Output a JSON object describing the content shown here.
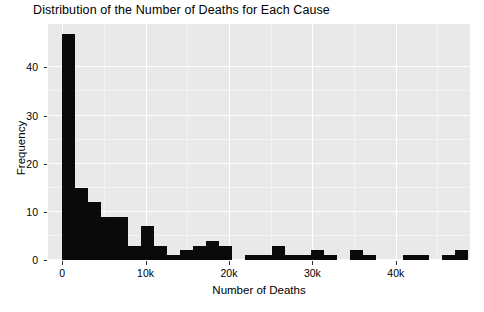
{
  "chart_data": {
    "type": "bar",
    "title": "Distribution of the Number of Deaths for Each Cause",
    "xlabel": "Number of Deaths",
    "ylabel": "Frequency",
    "xlim": [
      -1700,
      48900
    ],
    "ylim": [
      0,
      49
    ],
    "grid": true,
    "legend": null,
    "bin_width": 1570,
    "bar_color": "#0a0a0a",
    "panel_color": "#e9e9e9",
    "grid_color": "#ffffff",
    "xticks": [
      {
        "value": 0,
        "label": "0"
      },
      {
        "value": 10000,
        "label": "10k"
      },
      {
        "value": 20000,
        "label": "20k"
      },
      {
        "value": 30000,
        "label": "30k"
      },
      {
        "value": 40000,
        "label": "40k"
      }
    ],
    "yticks": [
      {
        "value": 0,
        "label": "0"
      },
      {
        "value": 10,
        "label": "10"
      },
      {
        "value": 20,
        "label": "20"
      },
      {
        "value": 30,
        "label": "30"
      },
      {
        "value": 40,
        "label": "40"
      }
    ],
    "bins": [
      {
        "x0": 0,
        "x1": 1570,
        "value": 47
      },
      {
        "x0": 1570,
        "x1": 3140,
        "value": 15
      },
      {
        "x0": 3140,
        "x1": 4710,
        "value": 12
      },
      {
        "x0": 4710,
        "x1": 6280,
        "value": 9
      },
      {
        "x0": 6280,
        "x1": 7850,
        "value": 9
      },
      {
        "x0": 7850,
        "x1": 9420,
        "value": 3
      },
      {
        "x0": 9420,
        "x1": 10990,
        "value": 7
      },
      {
        "x0": 10990,
        "x1": 12560,
        "value": 3
      },
      {
        "x0": 12560,
        "x1": 14130,
        "value": 1
      },
      {
        "x0": 14130,
        "x1": 15700,
        "value": 2
      },
      {
        "x0": 15700,
        "x1": 17270,
        "value": 3
      },
      {
        "x0": 17270,
        "x1": 18840,
        "value": 4
      },
      {
        "x0": 18840,
        "x1": 20410,
        "value": 3
      },
      {
        "x0": 20410,
        "x1": 21980,
        "value": 0
      },
      {
        "x0": 21980,
        "x1": 23550,
        "value": 1
      },
      {
        "x0": 23550,
        "x1": 25120,
        "value": 1
      },
      {
        "x0": 25120,
        "x1": 26690,
        "value": 3
      },
      {
        "x0": 26690,
        "x1": 28260,
        "value": 1
      },
      {
        "x0": 28260,
        "x1": 29830,
        "value": 1
      },
      {
        "x0": 29830,
        "x1": 31400,
        "value": 2
      },
      {
        "x0": 31400,
        "x1": 32970,
        "value": 1
      },
      {
        "x0": 32970,
        "x1": 34540,
        "value": 0
      },
      {
        "x0": 34540,
        "x1": 36110,
        "value": 2
      },
      {
        "x0": 36110,
        "x1": 37680,
        "value": 1
      },
      {
        "x0": 37680,
        "x1": 39250,
        "value": 0
      },
      {
        "x0": 39250,
        "x1": 40820,
        "value": 0
      },
      {
        "x0": 40820,
        "x1": 42390,
        "value": 1
      },
      {
        "x0": 42390,
        "x1": 43960,
        "value": 1
      },
      {
        "x0": 43960,
        "x1": 45530,
        "value": 0
      },
      {
        "x0": 45530,
        "x1": 47100,
        "value": 1
      },
      {
        "x0": 47100,
        "x1": 48670,
        "value": 2
      }
    ]
  }
}
